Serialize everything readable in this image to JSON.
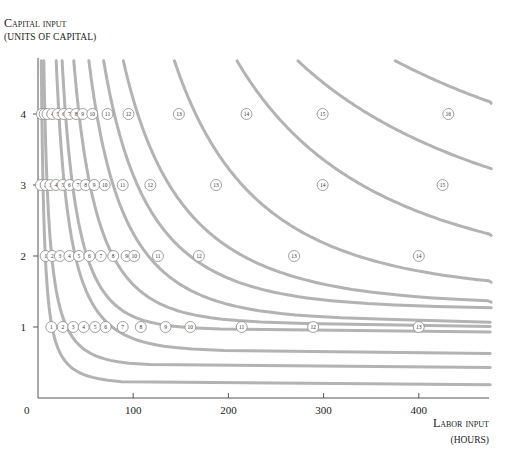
{
  "chart_data": {
    "type": "line",
    "title": "",
    "ylabel": "Capital input (units of capital)",
    "xlabel": "Labor input (hours)",
    "y_label_lines": [
      "Capital input",
      "(units of capital)"
    ],
    "x_label_lines": [
      "Labor input",
      "(hours)"
    ],
    "x_ticks": [
      0,
      100,
      200,
      300,
      400
    ],
    "y_ticks": [
      1,
      2,
      3,
      4
    ],
    "xlim": [
      0,
      480
    ],
    "ylim": [
      0,
      4.9
    ],
    "grid": false,
    "legend": "none",
    "series_description": "Isoquant curves (gray) with numbered output markers at capital levels 1, 2, 3 and 4",
    "markers": [
      {
        "capital": 4,
        "points": [
          {
            "label": "1",
            "labor": 4
          },
          {
            "label": "2",
            "labor": 7
          },
          {
            "label": "3",
            "labor": 10
          },
          {
            "label": "4",
            "labor": 15
          },
          {
            "label": "5",
            "labor": 21
          },
          {
            "label": "6",
            "labor": 27
          },
          {
            "label": "7",
            "labor": 33
          },
          {
            "label": "8",
            "labor": 40
          },
          {
            "label": "9",
            "labor": 47
          },
          {
            "label": "10",
            "labor": 57
          },
          {
            "label": "11",
            "labor": 73
          },
          {
            "label": "12",
            "labor": 95
          },
          {
            "label": "13",
            "labor": 148
          },
          {
            "label": "14",
            "labor": 219
          },
          {
            "label": "15",
            "labor": 299
          },
          {
            "label": "16",
            "labor": 431
          }
        ]
      },
      {
        "capital": 3,
        "points": [
          {
            "label": "1",
            "labor": 3
          },
          {
            "label": "2",
            "labor": 8
          },
          {
            "label": "3",
            "labor": 13
          },
          {
            "label": "4",
            "labor": 19
          },
          {
            "label": "5",
            "labor": 26
          },
          {
            "label": "6",
            "labor": 33
          },
          {
            "label": "7",
            "labor": 42
          },
          {
            "label": "8",
            "labor": 50
          },
          {
            "label": "9",
            "labor": 59
          },
          {
            "label": "10",
            "labor": 70
          },
          {
            "label": "11",
            "labor": 89
          },
          {
            "label": "12",
            "labor": 118
          },
          {
            "label": "13",
            "labor": 187
          },
          {
            "label": "14",
            "labor": 299
          },
          {
            "label": "15",
            "labor": 425
          }
        ]
      },
      {
        "capital": 2,
        "points": [
          {
            "label": "1",
            "labor": 8
          },
          {
            "label": "2",
            "labor": 15
          },
          {
            "label": "3",
            "labor": 23
          },
          {
            "label": "4",
            "labor": 33
          },
          {
            "label": "5",
            "labor": 43
          },
          {
            "label": "6",
            "labor": 54
          },
          {
            "label": "7",
            "labor": 66
          },
          {
            "label": "8",
            "labor": 79
          },
          {
            "label": "9",
            "labor": 93
          },
          {
            "label": "10",
            "labor": 101
          },
          {
            "label": "11",
            "labor": 126
          },
          {
            "label": "12",
            "labor": 169
          },
          {
            "label": "13",
            "labor": 269
          },
          {
            "label": "14",
            "labor": 400
          }
        ]
      },
      {
        "capital": 1,
        "points": [
          {
            "label": "1",
            "labor": 14
          },
          {
            "label": "2",
            "labor": 26
          },
          {
            "label": "3",
            "labor": 37
          },
          {
            "label": "4",
            "labor": 48
          },
          {
            "label": "5",
            "labor": 60
          },
          {
            "label": "6",
            "labor": 71
          },
          {
            "label": "7",
            "labor": 89
          },
          {
            "label": "8",
            "labor": 108
          },
          {
            "label": "9",
            "labor": 134
          },
          {
            "label": "10",
            "labor": 160
          },
          {
            "label": "11",
            "labor": 214
          },
          {
            "label": "12",
            "labor": 289
          },
          {
            "label": "13",
            "labor": 400
          }
        ]
      }
    ]
  },
  "axes": {
    "origin_label": "0",
    "x_tick_labels": [
      "100",
      "200",
      "300",
      "400"
    ],
    "y_tick_labels": [
      "1",
      "2",
      "3",
      "4"
    ]
  },
  "colors": {
    "curve": "#b3b3b3",
    "axis": "#555555",
    "marker_fill": "#ffffff",
    "marker_stroke": "#8a8a8a"
  }
}
